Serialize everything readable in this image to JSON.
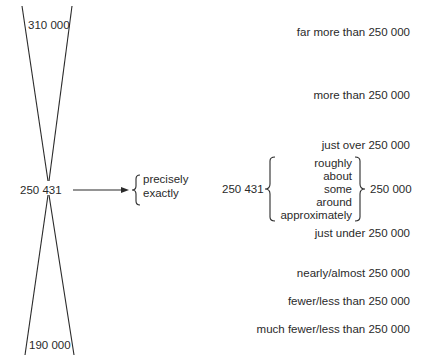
{
  "left": {
    "top_value": "310 000",
    "center_value": "250 431",
    "bottom_value": "190 000",
    "exact_words": [
      "precisely",
      "exactly"
    ]
  },
  "right": {
    "scale": [
      "far more than 250 000",
      "more than 250 000",
      "just over 250 000",
      "just under 250 000",
      "nearly/almost 250 000",
      "fewer/less than 250 000",
      "much fewer/less than 250 000"
    ],
    "approx_source": "250 431",
    "approx_words": [
      "roughly",
      "about",
      "some",
      "around",
      "approximately"
    ],
    "approx_target": "250 000"
  }
}
